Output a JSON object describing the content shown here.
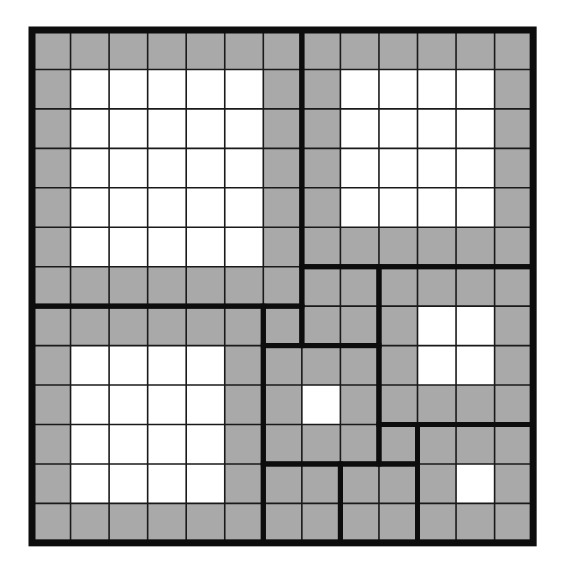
{
  "diagram": {
    "type": "squared-square-tiling",
    "grid_units": 13,
    "colors": {
      "background": "#ffffff",
      "border_fill": "#a9a9a9",
      "interior_fill": "#ffffff",
      "grid_line": "#1a1a1a",
      "square_outline": "#0d0d0d"
    },
    "geometry": {
      "origin_x": 32,
      "origin_y": 30,
      "cell_w": 38.55,
      "cell_h": 39.45,
      "thin_line_width": 1.6,
      "square_outline_width": 5,
      "outer_border_width": 7
    },
    "squares": [
      {
        "id": "sq-7-top-left",
        "col": 0,
        "row": 0,
        "size": 7
      },
      {
        "id": "sq-6-top-right",
        "col": 7,
        "row": 0,
        "size": 6
      },
      {
        "id": "sq-6-bottom-left",
        "col": 0,
        "row": 7,
        "size": 6
      },
      {
        "id": "sq-1-a",
        "col": 6,
        "row": 7,
        "size": 1
      },
      {
        "id": "sq-2-a",
        "col": 7,
        "row": 6,
        "size": 2
      },
      {
        "id": "sq-4-right",
        "col": 9,
        "row": 6,
        "size": 4
      },
      {
        "id": "sq-3-center",
        "col": 6,
        "row": 8,
        "size": 3
      },
      {
        "id": "sq-1-b",
        "col": 9,
        "row": 10,
        "size": 1
      },
      {
        "id": "sq-3-bottom-right",
        "col": 10,
        "row": 10,
        "size": 3
      },
      {
        "id": "sq-2-bottom-a",
        "col": 6,
        "row": 11,
        "size": 2
      },
      {
        "id": "sq-2-bottom-b",
        "col": 8,
        "row": 11,
        "size": 2
      }
    ]
  }
}
